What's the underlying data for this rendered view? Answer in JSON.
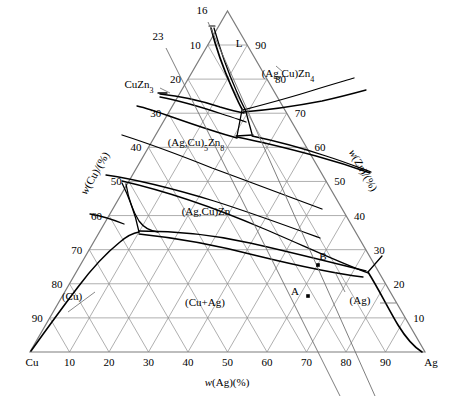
{
  "figure": {
    "kind": "ternary-phase-diagram",
    "system": "Ag-Cu-Zn",
    "background_color": "#ffffff",
    "grid_color": "#8c8c8c",
    "curve_color": "#000000",
    "axis_color": "#7a7a7a"
  },
  "axes": {
    "bottom": {
      "title": "w(Ag)(%)",
      "left_corner": "Cu",
      "right_corner": "Ag",
      "ticks": [
        "10",
        "20",
        "30",
        "40",
        "50",
        "60",
        "70",
        "80",
        "90"
      ]
    },
    "left": {
      "title": "w(Cu)/(%)",
      "ticks": [
        "10",
        "20",
        "30",
        "40",
        "50",
        "60",
        "70",
        "80",
        "90"
      ]
    },
    "right": {
      "title": "w(Zn)/(%)",
      "ticks": [
        "10",
        "20",
        "30",
        "40",
        "50",
        "60",
        "70",
        "80",
        "90"
      ]
    }
  },
  "phase_labels": [
    {
      "id": "liquid",
      "text": "L",
      "x": 239,
      "y": 47
    },
    {
      "id": "cuzn3",
      "text": "CuZn",
      "sub": "3",
      "x": 139,
      "y": 88
    },
    {
      "id": "agcu-zn4",
      "text": "(Ag,Cu)Zn",
      "sub": "4",
      "x": 288,
      "y": 77
    },
    {
      "id": "agcu5-zn8",
      "text": "(Ag,Cu)",
      "sub": "5",
      "text2": "Zn",
      "sub2": "8",
      "x": 196,
      "y": 146
    },
    {
      "id": "agcu-zn",
      "text": "(Ag,Cu)Zn",
      "x": 206,
      "y": 215
    },
    {
      "id": "cu-solid",
      "text": "(Cu)",
      "x": 72,
      "y": 300
    },
    {
      "id": "cu-plus-ag",
      "text": "(Cu+Ag)",
      "x": 205,
      "y": 306
    },
    {
      "id": "ag-solid",
      "text": "(Ag)",
      "x": 360,
      "y": 304
    }
  ],
  "markers": [
    {
      "id": "point-A",
      "label": "A",
      "x": 308,
      "y": 296,
      "label_dx": -13,
      "label_dy": -1
    },
    {
      "id": "point-B",
      "label": "B",
      "x": 318,
      "y": 265,
      "label_dx": 5,
      "label_dy": -5
    }
  ],
  "construction_lines": [
    {
      "id": "line-16",
      "label": "16",
      "label_x": 202,
      "label_y": 14
    },
    {
      "id": "line-23",
      "label": "23",
      "label_x": 158,
      "label_y": 40
    }
  ],
  "colors": {
    "grid": "#8c8c8c",
    "boundary": "#000000",
    "axis": "#808080",
    "text": "#000000"
  }
}
